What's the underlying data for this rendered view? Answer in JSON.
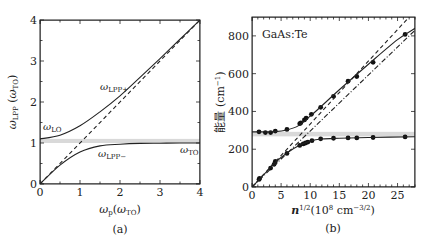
{
  "chart_data": [
    {
      "panel": "(a)",
      "type": "line",
      "title": "",
      "xlabel": "ω_p(ω_TO)",
      "ylabel": "ω_LPP (ω_TO)",
      "xlim": [
        0,
        4
      ],
      "ylim": [
        0,
        4
      ],
      "xticks": [
        "0",
        "1",
        "2",
        "3",
        "4"
      ],
      "yticks": [
        "0",
        "1",
        "2",
        "3",
        "4"
      ],
      "grid": false,
      "band": {
        "from": 1.0,
        "to": 1.1,
        "color": "#d9d9d9"
      },
      "annotations": [
        "ω_LO",
        "ω_LPP+",
        "ω_LPP−",
        "ω_TO"
      ],
      "series": [
        {
          "name": "ω_LPP+",
          "style": "solid",
          "x": [
            0,
            0.5,
            1.0,
            1.5,
            2.0,
            2.5,
            3.0,
            3.5,
            4.0
          ],
          "y": [
            1.1,
            1.19,
            1.42,
            1.76,
            2.15,
            2.6,
            3.06,
            3.53,
            4.0
          ]
        },
        {
          "name": "ω_LPP−",
          "style": "solid",
          "x": [
            0,
            0.5,
            1.0,
            1.5,
            2.0,
            2.5,
            3.0,
            3.5,
            4.0
          ],
          "y": [
            0,
            0.46,
            0.78,
            0.93,
            0.97,
            0.99,
            0.995,
            1.0,
            1.0
          ]
        },
        {
          "name": "ω_p (asymptote)",
          "style": "dashed",
          "x": [
            0,
            4
          ],
          "y": [
            0,
            4
          ]
        }
      ]
    },
    {
      "panel": "(b)",
      "type": "scatter",
      "title": "",
      "annotation": "GaAs:Te",
      "xlabel": "n^1/2(10^8 cm^-3/2)",
      "ylabel": "能量 (cm⁻¹)",
      "xlim": [
        0,
        28
      ],
      "ylim": [
        0,
        900
      ],
      "xticks": [
        "0",
        "5",
        "10",
        "15",
        "20",
        "25"
      ],
      "yticks": [
        "0",
        "200",
        "400",
        "600",
        "800"
      ],
      "grid": false,
      "band": {
        "from": 268,
        "to": 292,
        "color": "#d9d9d9"
      },
      "series": [
        {
          "name": "upper branch (data)",
          "marker": "circle",
          "x": [
            1.2,
            2.3,
            3.2,
            4.0,
            6.0,
            8.2,
            8.4,
            9.0,
            9.3,
            10.2,
            11.8,
            14.0,
            16.5,
            18.0,
            20.8,
            26.3
          ],
          "y": [
            292,
            288,
            288,
            296,
            305,
            335,
            340,
            355,
            365,
            385,
            422,
            480,
            560,
            585,
            660,
            808
          ]
        },
        {
          "name": "lower branch (data)",
          "marker": "circle",
          "x": [
            1.2,
            1.3,
            3.2,
            3.8,
            4.0,
            6.0,
            8.2,
            8.8,
            9.2,
            9.6,
            10.3,
            11.8,
            14.0,
            16.5,
            18.0,
            20.8,
            26.3
          ],
          "y": [
            40,
            45,
            100,
            120,
            135,
            178,
            220,
            228,
            233,
            238,
            245,
            255,
            258,
            260,
            260,
            262,
            265
          ]
        },
        {
          "name": "upper branch (fit)",
          "style": "solid",
          "x": [
            0,
            4,
            6,
            8,
            10,
            12,
            15,
            20,
            25,
            28
          ],
          "y": [
            292,
            293,
            302,
            325,
            375,
            430,
            515,
            650,
            780,
            840
          ]
        },
        {
          "name": "lower branch (fit)",
          "style": "solid",
          "x": [
            0,
            2,
            4,
            6,
            8,
            10,
            12,
            15,
            20,
            28
          ],
          "y": [
            0,
            65,
            130,
            180,
            218,
            243,
            254,
            258,
            262,
            266
          ]
        },
        {
          "name": "plasma asymptote",
          "style": "dashed",
          "x": [
            0,
            27
          ],
          "y": [
            0,
            900
          ]
        },
        {
          "name": "alt asymptote",
          "style": "dash-dot",
          "x": [
            0,
            28
          ],
          "y": [
            0,
            830
          ]
        }
      ]
    }
  ],
  "panels": {
    "a": {
      "caption": "(a)"
    },
    "b": {
      "caption": "(b)"
    }
  }
}
